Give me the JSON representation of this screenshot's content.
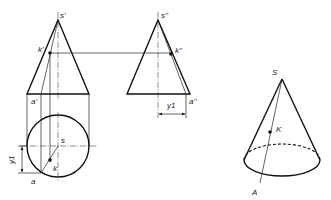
{
  "figure": {
    "front_view": {
      "apex_label": "s'",
      "point_label": "k'",
      "base_point_label": "a'"
    },
    "side_view": {
      "apex_label": "s''",
      "point_label": "k''",
      "base_point_label": "a''",
      "dimension_label": "y1"
    },
    "top_view": {
      "center_label": "s",
      "point_label": "k",
      "base_point_label": "a",
      "dimension_label": "y1"
    },
    "pictorial_view": {
      "apex_label": "S",
      "point_label": "K",
      "base_point_label": "A"
    }
  },
  "colors": {
    "line": "#111111",
    "background": "#ffffff"
  }
}
